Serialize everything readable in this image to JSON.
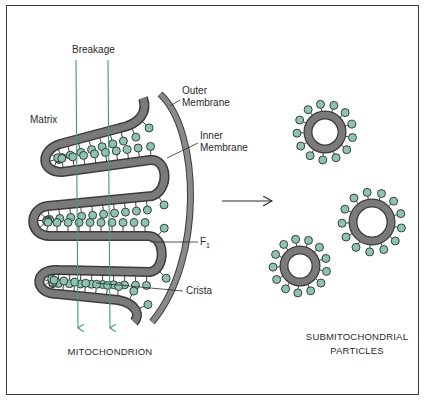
{
  "labels": {
    "breakage": "Breakage",
    "matrix": "Matrix",
    "outer_membrane_line1": "Outer",
    "outer_membrane_line2": "Membrane",
    "inner_membrane_line1": "Inner",
    "inner_membrane_line2": "Membrane",
    "f1_main": "F",
    "f1_sub": "1",
    "crista": "Crista"
  },
  "captions": {
    "mitochondrion": "MITOCHONDRION",
    "smp_line1": "SUBMITOCHONDRIAL",
    "smp_line2": "PARTICLES"
  },
  "colors": {
    "membrane_fill": "#7a7a7a",
    "membrane_edge": "#3c3c3c",
    "f1_particle": "#8cc4b0",
    "breakage_line": "#3f9a80",
    "frame": "#3a3a3a"
  },
  "particles": [
    {
      "cx": 325,
      "cy": 132,
      "r": 17
    },
    {
      "cx": 372,
      "cy": 222,
      "r": 19
    },
    {
      "cx": 300,
      "cy": 266,
      "r": 16
    }
  ]
}
